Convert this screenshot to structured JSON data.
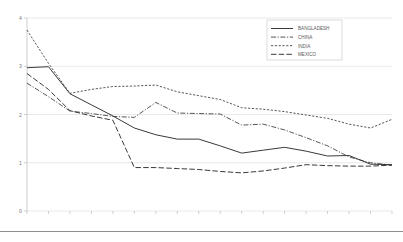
{
  "chart_data": {
    "type": "line",
    "title": "",
    "xlabel": "",
    "ylabel": "",
    "xlim": [
      1990,
      2007
    ],
    "ylim": [
      0,
      4
    ],
    "yticks": [
      0,
      1,
      2,
      3,
      4
    ],
    "grid": true,
    "legend_position": "top-right",
    "categories": [
      "1990",
      "1991",
      "1992",
      "1993",
      "1994",
      "1995",
      "1996",
      "1997",
      "1998",
      "1999",
      "2000",
      "2001",
      "2002",
      "2003",
      "2004",
      "2005",
      "2006",
      "2007"
    ],
    "x": [
      1990,
      1991,
      1992,
      1993,
      1994,
      1995,
      1996,
      1997,
      1998,
      1999,
      2000,
      2001,
      2002,
      2003,
      2004,
      2005,
      2006,
      2007
    ],
    "series": [
      {
        "name": "BANGLADESH",
        "style": "solid",
        "values": [
          2.97,
          2.99,
          2.43,
          2.2,
          1.97,
          1.72,
          1.58,
          1.49,
          1.49,
          1.35,
          1.2,
          1.26,
          1.32,
          1.24,
          1.14,
          1.15,
          0.97,
          0.96
        ]
      },
      {
        "name": "CHINA",
        "style": "dash-dot",
        "values": [
          2.65,
          2.37,
          2.07,
          2.02,
          1.96,
          1.94,
          2.25,
          2.03,
          2.02,
          2.01,
          1.78,
          1.8,
          1.68,
          1.52,
          1.35,
          1.12,
          1.0,
          0.95
        ]
      },
      {
        "name": "INDIA",
        "style": "dotted",
        "values": [
          3.75,
          3.06,
          2.44,
          2.52,
          2.58,
          2.59,
          2.61,
          2.47,
          2.39,
          2.31,
          2.14,
          2.11,
          2.06,
          1.99,
          1.92,
          1.8,
          1.72,
          1.9
        ]
      },
      {
        "name": "MEXICO",
        "style": "long-dash",
        "values": [
          2.85,
          2.52,
          2.08,
          1.97,
          1.88,
          0.9,
          0.9,
          0.88,
          0.86,
          0.82,
          0.79,
          0.83,
          0.89,
          0.96,
          0.94,
          0.93,
          0.93,
          0.95
        ]
      }
    ]
  },
  "legend": {
    "items": [
      {
        "label": "BANGLADESH"
      },
      {
        "label": "CHINA"
      },
      {
        "label": "INDIA"
      },
      {
        "label": "MEXICO"
      }
    ]
  }
}
